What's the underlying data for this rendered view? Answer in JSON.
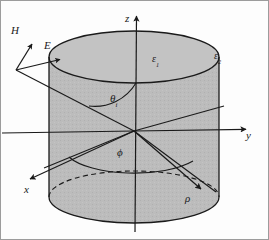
{
  "figure": {
    "caption": "",
    "background_color": "#fdfdfd",
    "cylinder_fill_color": "#b4b4b4",
    "line_color": "#1a1a1a",
    "border_color": "#9a9a9a"
  },
  "axes": [
    {
      "id": "z",
      "label": "z",
      "label_x": 126,
      "label_y": 15,
      "direction": "up",
      "arrow_tip_x": 137,
      "arrow_tip_y": 9
    },
    {
      "id": "y",
      "label": "y",
      "label_x": 247,
      "label_y": 134,
      "direction": "right",
      "arrow_tip_x": 252,
      "arrow_tip_y": 129
    },
    {
      "id": "x",
      "label": "x",
      "label_x": 26,
      "label_y": 190,
      "direction": "down-left",
      "arrow_tip_x": 26,
      "arrow_tip_y": 181
    }
  ],
  "field_vectors": [
    {
      "id": "H",
      "label": "H",
      "label_x": 13,
      "label_y": 29,
      "tail_x": 17,
      "tail_y": 70,
      "tip_x": 33,
      "tip_y": 42
    },
    {
      "id": "E",
      "label": "E",
      "label_x": 45,
      "label_y": 45,
      "tail_x": 17,
      "tail_y": 70,
      "tip_x": 62,
      "tip_y": 59
    }
  ],
  "media_labels": [
    {
      "id": "epsilon_1",
      "base": "ε",
      "sub": "1",
      "x": 155,
      "y": 59,
      "region": "inside-cylinder"
    },
    {
      "id": "epsilon_2",
      "base": "ε",
      "sub": "2",
      "x": 216,
      "y": 55,
      "region": "outside-cylinder"
    }
  ],
  "angles": [
    {
      "id": "theta_i",
      "base": "θ",
      "sub": "i",
      "x": 113,
      "y": 98,
      "description": "polar angle of incidence measured from z axis"
    },
    {
      "id": "phi",
      "base": "ϕ",
      "sub": "",
      "x": 118,
      "y": 152,
      "description": "azimuthal angle measured from x axis"
    }
  ],
  "radial_label": {
    "id": "rho",
    "base": "ρ",
    "sub": "",
    "x": 186,
    "y": 198,
    "description": "radial cylindrical coordinate"
  },
  "geometry": {
    "origin": {
      "x": 134,
      "y": 131
    },
    "cylinder": {
      "center_x": 134,
      "top_ellipse_cy": 57,
      "bottom_ellipse_cy": 197,
      "rx": 85,
      "ry": 26
    },
    "incident_ray": {
      "x1": 17,
      "y1": 70,
      "x2": 134,
      "y2": 131
    },
    "transmitted_ray": {
      "x1": 134,
      "y1": 131,
      "x2": 222,
      "y2": 107
    },
    "reflected_ray": {
      "x1": 134,
      "y1": 131,
      "x2": 213,
      "y2": 190
    },
    "rho_arrow": {
      "x1": 134,
      "y1": 131,
      "x2": 205,
      "y2": 192
    },
    "x_axis_ray": {
      "x1": 134,
      "y1": 131,
      "x2": 26,
      "y2": 181
    },
    "y_axis_ray": {
      "x1": 134,
      "y1": 131,
      "x2": 252,
      "y2": 129
    },
    "z_axis_ray": {
      "x1": 134,
      "y1": 131,
      "x2": 137,
      "y2": 9
    }
  }
}
